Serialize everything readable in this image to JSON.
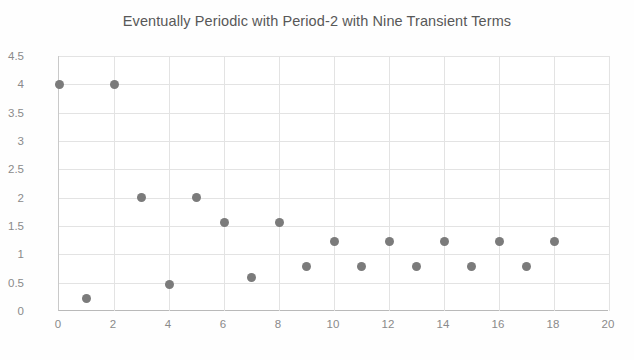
{
  "chart_data": {
    "type": "scatter",
    "title": "Eventually Periodic with Period-2 with Nine Transient Terms",
    "xlabel": "",
    "ylabel": "",
    "xlim": [
      0,
      20
    ],
    "ylim": [
      0,
      4.5
    ],
    "xticks": [
      0,
      2,
      4,
      6,
      8,
      10,
      12,
      14,
      16,
      18,
      20
    ],
    "xtick_labels": [
      "0",
      "2",
      "4",
      "6",
      "8",
      "10",
      "12",
      "14",
      "16",
      "18",
      "20"
    ],
    "yticks": [
      0,
      0.5,
      1,
      1.5,
      2,
      2.5,
      3,
      3.5,
      4,
      4.5
    ],
    "ytick_labels": [
      "0",
      "0.5",
      "1",
      "1.5",
      "2",
      "2.5",
      "3",
      "3.5",
      "4",
      "4.5"
    ],
    "grid": true,
    "legend": null,
    "marker_color": "#7b7b7b",
    "gridline_color": "#e3e3e3",
    "axis_color": "#b9b9b9",
    "title_color": "#585858",
    "tick_label_color": "#8a8a8a",
    "background_color": "#ffffff",
    "series": [
      {
        "name": "sequence",
        "x": [
          0,
          1,
          2,
          3,
          4,
          5,
          6,
          7,
          8,
          9,
          10,
          11,
          12,
          13,
          14,
          15,
          16,
          17,
          18
        ],
        "y": [
          4,
          0.22,
          4,
          2,
          0.47,
          2,
          1.57,
          0.6,
          1.57,
          0.78,
          1.23,
          0.78,
          1.23,
          0.78,
          1.23,
          0.78,
          1.23,
          0.78,
          1.23
        ]
      }
    ],
    "annotations": []
  }
}
